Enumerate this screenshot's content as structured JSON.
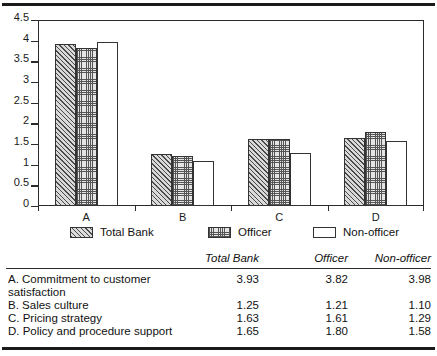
{
  "chart_data": {
    "type": "bar",
    "title": "",
    "xlabel": "",
    "ylabel": "",
    "ylim": [
      0,
      4.5
    ],
    "ytick_labels": [
      "0",
      "0.5",
      "1",
      "1.5",
      "2",
      "2.5",
      "3",
      "3.5",
      "4",
      "4.5"
    ],
    "ytick_values": [
      0,
      0.5,
      1,
      1.5,
      2,
      2.5,
      3,
      3.5,
      4,
      4.5
    ],
    "grid": false,
    "legend_position": "below",
    "categories": [
      "A",
      "B",
      "C",
      "D"
    ],
    "series": [
      {
        "name": "Total Bank",
        "pattern": "hatch",
        "values": [
          3.93,
          1.25,
          1.63,
          1.65
        ]
      },
      {
        "name": "Officer",
        "pattern": "stipple",
        "values": [
          3.82,
          1.21,
          1.61,
          1.8
        ]
      },
      {
        "name": "Non-officer",
        "pattern": "plain",
        "values": [
          3.98,
          1.1,
          1.29,
          1.58
        ]
      }
    ]
  },
  "legend": {
    "items": [
      {
        "label": "Total Bank",
        "pattern": "hatch"
      },
      {
        "label": "Officer",
        "pattern": "stipple"
      },
      {
        "label": "Non-officer",
        "pattern": "plain"
      }
    ]
  },
  "table": {
    "headers": [
      "Total Bank",
      "Officer",
      "Non-officer"
    ],
    "rows": [
      {
        "label": "A.  Commitment to customer\nsatisfaction",
        "values": [
          "3.93",
          "3.82",
          "3.98"
        ]
      },
      {
        "label": "B.  Sales culture",
        "values": [
          "1.25",
          "1.21",
          "1.10"
        ]
      },
      {
        "label": "C.  Pricing strategy",
        "values": [
          "1.63",
          "1.61",
          "1.29"
        ]
      },
      {
        "label": "D.  Policy and procedure support",
        "values": [
          "1.65",
          "1.80",
          "1.58"
        ]
      }
    ]
  },
  "colors": {
    "ink": "#1b1b1b",
    "bar_outline": "#333333",
    "hatch_fill": "#d9d9d9",
    "stipple_fill": "#e4e4e4",
    "plain_fill": "#ffffff"
  }
}
